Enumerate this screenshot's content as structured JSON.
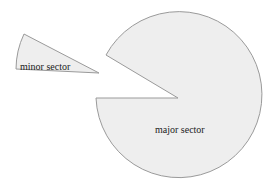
{
  "diagram": {
    "labels": {
      "minor": "minor sector",
      "major": "major sector"
    },
    "colors": {
      "fill": "#eeeeee",
      "stroke": "#9a9a9a",
      "text": "#222222"
    }
  }
}
